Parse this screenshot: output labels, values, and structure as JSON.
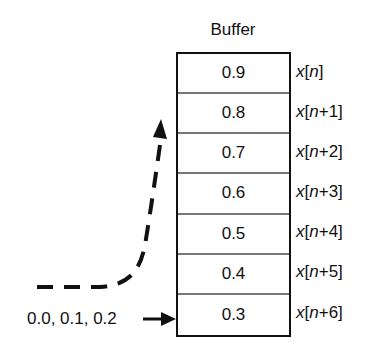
{
  "title": "Buffer",
  "buffer": {
    "cells": [
      {
        "value": "0.9",
        "label_var": "x",
        "label_idx": "n",
        "label_suffix": ""
      },
      {
        "value": "0.8",
        "label_var": "x",
        "label_idx": "n",
        "label_suffix": "+1"
      },
      {
        "value": "0.7",
        "label_var": "x",
        "label_idx": "n",
        "label_suffix": "+2"
      },
      {
        "value": "0.6",
        "label_var": "x",
        "label_idx": "n",
        "label_suffix": "+3"
      },
      {
        "value": "0.5",
        "label_var": "x",
        "label_idx": "n",
        "label_suffix": "+4"
      },
      {
        "value": "0.4",
        "label_var": "x",
        "label_idx": "n",
        "label_suffix": "+5"
      },
      {
        "value": "0.3",
        "label_var": "x",
        "label_idx": "n",
        "label_suffix": "+6"
      }
    ]
  },
  "input": {
    "label": "0.0, 0.1, 0.2"
  },
  "arrows": {
    "input_arrow": "solid-right",
    "shift_arrow": "dashed-curve-up"
  }
}
